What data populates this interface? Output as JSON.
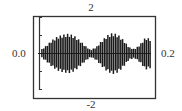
{
  "chart_data": {
    "type": "line",
    "title": "",
    "xlabel": "",
    "ylabel": "",
    "xlim": [
      0.0,
      0.2
    ],
    "ylim": [
      -2,
      2
    ],
    "x_tick_labels": [
      "0.0",
      "0.2"
    ],
    "y_tick_labels": [
      "2",
      "-2"
    ],
    "grid": false,
    "legend": null,
    "series": [
      {
        "name": "signal",
        "envelope_x": [
          0.0,
          0.01,
          0.02,
          0.03,
          0.04,
          0.05,
          0.06,
          0.07,
          0.08,
          0.09,
          0.1,
          0.11,
          0.12,
          0.13,
          0.14,
          0.15,
          0.16,
          0.17,
          0.18,
          0.19,
          0.2
        ],
        "envelope_amplitude": [
          0.2,
          0.45,
          0.75,
          0.95,
          1.05,
          1.1,
          1.0,
          0.75,
          0.45,
          0.2,
          0.35,
          0.7,
          1.0,
          1.15,
          1.05,
          0.75,
          0.35,
          0.25,
          0.5,
          0.9,
          0.8
        ],
        "carrier_cycles": 30
      }
    ]
  },
  "labels": {
    "y_top": "2",
    "y_bottom": "-2",
    "x_left": "0.0",
    "x_right": "0.2"
  }
}
